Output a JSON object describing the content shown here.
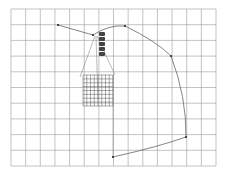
{
  "canvas": {
    "background": "#ffffff",
    "grid": {
      "left": 11,
      "top": 9,
      "right": 216,
      "bottom": 166,
      "cols": 14,
      "rows": 10,
      "line_color": "#9a9a9a"
    },
    "fine_grid": {
      "left": 83,
      "top": 75,
      "right": 113,
      "bottom": 106,
      "cols": 8,
      "rows": 8,
      "line_color": "#555555"
    },
    "curve": {
      "color": "#666666",
      "points": [
        [
          58,
          25
        ],
        [
          93,
          35
        ],
        [
          125,
          26
        ],
        [
          171,
          56
        ],
        [
          186,
          137
        ],
        [
          113,
          157
        ]
      ]
    }
  },
  "toolbar": {
    "items": [
      {
        "name": "tool-1"
      },
      {
        "name": "tool-2"
      },
      {
        "name": "tool-3"
      },
      {
        "name": "tool-4"
      },
      {
        "name": "tool-5"
      }
    ]
  }
}
